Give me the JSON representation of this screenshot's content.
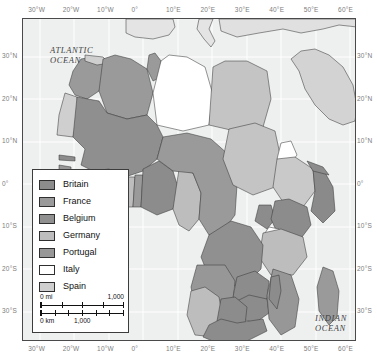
{
  "map": {
    "title": "Colonial Africa",
    "frame": {
      "left": 22,
      "top": 18,
      "width": 334,
      "height": 323
    },
    "projection_extent": {
      "lon_min": -35,
      "lon_max": 62,
      "lat_min": -37,
      "lat_max": 39
    },
    "background_color": "#eef0ef",
    "graticule_color": "#ffffff",
    "border_color": "#4a4a4a"
  },
  "axes": {
    "longitude_labels": [
      "30°W",
      "20°W",
      "10°W",
      "0°",
      "10°E",
      "20°E",
      "30°E",
      "40°E",
      "50°E",
      "60°E"
    ],
    "longitude_values": [
      -30,
      -20,
      -10,
      0,
      10,
      20,
      30,
      40,
      50,
      60
    ],
    "latitude_labels": [
      "30°N",
      "20°N",
      "10°N",
      "0°",
      "10°S",
      "20°S",
      "30°S"
    ],
    "latitude_values": [
      30,
      20,
      10,
      0,
      -10,
      -20,
      -30
    ],
    "label_color": "#7d7d7d"
  },
  "ocean_labels": [
    {
      "name": "atlantic",
      "line1": "ATLANTIC",
      "line2": "OCEAN"
    },
    {
      "name": "indian",
      "line1": "INDIAN",
      "line2": "OCEAN"
    }
  ],
  "legend": {
    "items": [
      {
        "label": "Britain",
        "color": "#8c8c8c"
      },
      {
        "label": "France",
        "color": "#9a9a9a"
      },
      {
        "label": "Belgium",
        "color": "#909090"
      },
      {
        "label": "Germany",
        "color": "#bdbdbd"
      },
      {
        "label": "Portugal",
        "color": "#979797"
      },
      {
        "label": "Italy",
        "color": "#ffffff"
      },
      {
        "label": "Spain",
        "color": "#cfcfcf"
      }
    ]
  },
  "scalebar": {
    "miles": {
      "zero_label": "0 mi",
      "max_label": "1,000",
      "divisions": 4
    },
    "kilometers": {
      "zero_label": "0 km",
      "max_label": "1,000",
      "divisions": 6
    }
  },
  "chart_data": {
    "type": "map",
    "categories": [
      "Britain",
      "France",
      "Belgium",
      "Germany",
      "Portugal",
      "Italy",
      "Spain"
    ],
    "legend_position": "lower-left",
    "territories": [
      {
        "name": "Morocco",
        "power": "France",
        "fill": "#9a9a9a"
      },
      {
        "name": "Spanish Morocco",
        "power": "Spain",
        "fill": "#cfcfcf"
      },
      {
        "name": "Rio de Oro",
        "power": "Spain",
        "fill": "#cfcfcf"
      },
      {
        "name": "Algeria",
        "power": "France",
        "fill": "#9a9a9a"
      },
      {
        "name": "Tunisia",
        "power": "France",
        "fill": "#9a9a9a"
      },
      {
        "name": "Libya",
        "power": "Italy",
        "fill": "#ffffff"
      },
      {
        "name": "Egypt",
        "power": "Britain",
        "fill": "#c4c4c4"
      },
      {
        "name": "French West Africa",
        "power": "France",
        "fill": "#8f8f8f"
      },
      {
        "name": "Gambia",
        "power": "Britain",
        "fill": "#8c8c8c"
      },
      {
        "name": "Portuguese Guinea",
        "power": "Portugal",
        "fill": "#979797"
      },
      {
        "name": "Sierra Leone",
        "power": "Britain",
        "fill": "#8c8c8c"
      },
      {
        "name": "Liberia",
        "power": "independent",
        "fill": "#d8d8d8"
      },
      {
        "name": "Gold Coast",
        "power": "Britain",
        "fill": "#8c8c8c"
      },
      {
        "name": "Togoland",
        "power": "Germany",
        "fill": "#bdbdbd"
      },
      {
        "name": "Nigeria",
        "power": "Britain",
        "fill": "#8c8c8c"
      },
      {
        "name": "Kamerun",
        "power": "Germany",
        "fill": "#bdbdbd"
      },
      {
        "name": "French Equatorial Africa",
        "power": "France",
        "fill": "#9a9a9a"
      },
      {
        "name": "Anglo-Egyptian Sudan",
        "power": "Britain",
        "fill": "#c4c4c4"
      },
      {
        "name": "Eritrea",
        "power": "Italy",
        "fill": "#ffffff"
      },
      {
        "name": "Abyssinia",
        "power": "independent",
        "fill": "#c9c9c9"
      },
      {
        "name": "Italian Somaliland",
        "power": "Italy",
        "fill": "#8a8a8a"
      },
      {
        "name": "British Somaliland",
        "power": "Britain",
        "fill": "#8c8c8c"
      },
      {
        "name": "British East Africa",
        "power": "Britain",
        "fill": "#8c8c8c"
      },
      {
        "name": "Uganda",
        "power": "Britain",
        "fill": "#8c8c8c"
      },
      {
        "name": "German East Africa",
        "power": "Germany",
        "fill": "#bdbdbd"
      },
      {
        "name": "Belgian Congo",
        "power": "Belgium",
        "fill": "#909090"
      },
      {
        "name": "Angola",
        "power": "Portugal",
        "fill": "#979797"
      },
      {
        "name": "Mozambique",
        "power": "Portugal",
        "fill": "#979797"
      },
      {
        "name": "Northern Rhodesia",
        "power": "Britain",
        "fill": "#8c8c8c"
      },
      {
        "name": "Southern Rhodesia",
        "power": "Britain",
        "fill": "#8c8c8c"
      },
      {
        "name": "German South West Africa",
        "power": "Germany",
        "fill": "#bdbdbd"
      },
      {
        "name": "Bechuanaland",
        "power": "Britain",
        "fill": "#8c8c8c"
      },
      {
        "name": "Union of South Africa",
        "power": "Britain",
        "fill": "#8c8c8c"
      },
      {
        "name": "Madagascar",
        "power": "France",
        "fill": "#9a9a9a"
      }
    ]
  }
}
